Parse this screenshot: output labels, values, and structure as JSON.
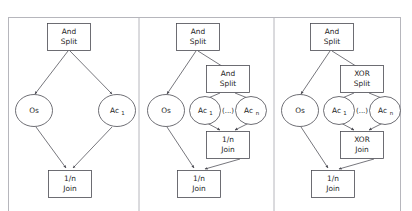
{
  "figure": {
    "title_fragment": "",
    "panel_count": 3,
    "frame_color": "#b6b6bc",
    "node_stroke_color": "#4a4a52",
    "node_fill_color": "#ffffff",
    "text_color": "#1d1d1d",
    "background_color": "#ffffff"
  },
  "panels": [
    {
      "id": "panel-a",
      "nodes": [
        {
          "id": "a-and-split",
          "shape": "rect",
          "line1": "And",
          "line2": "Split"
        },
        {
          "id": "a-os",
          "shape": "ellipse",
          "line1": "Os",
          "line2": ""
        },
        {
          "id": "a-ac1",
          "shape": "ellipse",
          "line1": "Ac",
          "sub": "1"
        },
        {
          "id": "a-join",
          "shape": "rect",
          "line1": "1/n",
          "line2": "Join"
        }
      ],
      "edges": [
        {
          "from": "a-and-split",
          "to": "a-os"
        },
        {
          "from": "a-and-split",
          "to": "a-ac1"
        },
        {
          "from": "a-os",
          "to": "a-join"
        },
        {
          "from": "a-ac1",
          "to": "a-join"
        }
      ]
    },
    {
      "id": "panel-b",
      "nodes": [
        {
          "id": "b-and-split-1",
          "shape": "rect",
          "line1": "And",
          "line2": "Split"
        },
        {
          "id": "b-os",
          "shape": "ellipse",
          "line1": "Os",
          "line2": ""
        },
        {
          "id": "b-and-split-2",
          "shape": "rect",
          "line1": "And",
          "line2": "Split"
        },
        {
          "id": "b-ac1",
          "shape": "ellipse",
          "line1": "Ac",
          "sub": "1"
        },
        {
          "id": "b-dots",
          "shape": "text",
          "line1": "(...)",
          "line2": ""
        },
        {
          "id": "b-acn",
          "shape": "ellipse",
          "line1": "Ac",
          "sub": "n"
        },
        {
          "id": "b-join-inner",
          "shape": "rect",
          "line1": "1/n",
          "line2": "Join"
        },
        {
          "id": "b-join-outer",
          "shape": "rect",
          "line1": "1/n",
          "line2": "Join"
        }
      ],
      "edges": [
        {
          "from": "b-and-split-1",
          "to": "b-os"
        },
        {
          "from": "b-and-split-1",
          "to": "b-and-split-2"
        },
        {
          "from": "b-and-split-2",
          "to": "b-ac1"
        },
        {
          "from": "b-and-split-2",
          "to": "b-acn"
        },
        {
          "from": "b-ac1",
          "to": "b-join-inner"
        },
        {
          "from": "b-acn",
          "to": "b-join-inner"
        },
        {
          "from": "b-os",
          "to": "b-join-outer"
        },
        {
          "from": "b-join-inner",
          "to": "b-join-outer"
        }
      ]
    },
    {
      "id": "panel-c",
      "nodes": [
        {
          "id": "c-and-split",
          "shape": "rect",
          "line1": "And",
          "line2": "Split"
        },
        {
          "id": "c-os",
          "shape": "ellipse",
          "line1": "Os",
          "line2": ""
        },
        {
          "id": "c-xor-split",
          "shape": "rect",
          "line1": "XOR",
          "line2": "Split"
        },
        {
          "id": "c-ac1",
          "shape": "ellipse",
          "line1": "Ac",
          "sub": "1"
        },
        {
          "id": "c-dots",
          "shape": "text",
          "line1": "(...)",
          "line2": ""
        },
        {
          "id": "c-acn",
          "shape": "ellipse",
          "line1": "Ac",
          "sub": "n"
        },
        {
          "id": "c-xor-join",
          "shape": "rect",
          "line1": "XOR",
          "line2": "Join"
        },
        {
          "id": "c-join-outer",
          "shape": "rect",
          "line1": "1/n",
          "line2": "Join"
        }
      ],
      "edges": [
        {
          "from": "c-and-split",
          "to": "c-os"
        },
        {
          "from": "c-and-split",
          "to": "c-xor-split"
        },
        {
          "from": "c-xor-split",
          "to": "c-ac1"
        },
        {
          "from": "c-xor-split",
          "to": "c-acn"
        },
        {
          "from": "c-ac1",
          "to": "c-xor-join"
        },
        {
          "from": "c-acn",
          "to": "c-xor-join"
        },
        {
          "from": "c-os",
          "to": "c-join-outer"
        },
        {
          "from": "c-xor-join",
          "to": "c-join-outer"
        }
      ]
    }
  ],
  "labels": {
    "a_and_split_l1": "And",
    "a_and_split_l2": "Split",
    "a_os": "Os",
    "a_ac_base": "Ac",
    "a_ac_sub": "1",
    "a_join_l1": "1/n",
    "a_join_l2": "Join",
    "b_and_split1_l1": "And",
    "b_and_split1_l2": "Split",
    "b_os": "Os",
    "b_and_split2_l1": "And",
    "b_and_split2_l2": "Split",
    "b_ac1_base": "Ac",
    "b_ac1_sub": "1",
    "b_dots": "(...)",
    "b_acn_base": "Ac",
    "b_acn_sub": "n",
    "b_join_inner_l1": "1/n",
    "b_join_inner_l2": "Join",
    "b_join_outer_l1": "1/n",
    "b_join_outer_l2": "Join",
    "c_and_split_l1": "And",
    "c_and_split_l2": "Split",
    "c_os": "Os",
    "c_xor_split_l1": "XOR",
    "c_xor_split_l2": "Split",
    "c_ac1_base": "Ac",
    "c_ac1_sub": "1",
    "c_dots": "(...)",
    "c_acn_base": "Ac",
    "c_acn_sub": "n",
    "c_xor_join_l1": "XOR",
    "c_xor_join_l2": "Join",
    "c_join_outer_l1": "1/n",
    "c_join_outer_l2": "Join"
  }
}
